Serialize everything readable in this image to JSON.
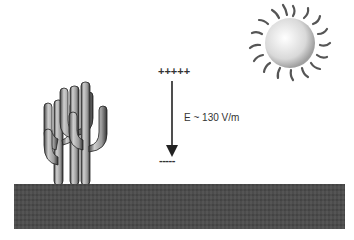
{
  "diagram": {
    "labels": {
      "positive_charges": "+++++",
      "negative_charges": "-----",
      "field_label": "E ~ 130 V/m"
    },
    "elements": [
      "cactus",
      "sun",
      "ground",
      "field-arrow"
    ],
    "colors": {
      "ground": "#4a4a4a",
      "text": "#333333",
      "sun": "#d8d8d8",
      "cactus": "#a8a8a8"
    }
  }
}
